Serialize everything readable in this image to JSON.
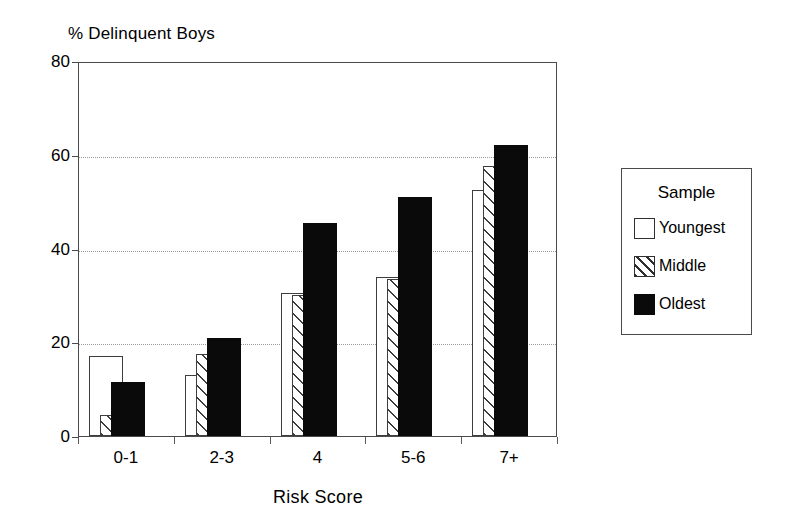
{
  "chart_data": {
    "type": "bar",
    "title": "",
    "xlabel": "Risk Score",
    "ylabel": "% Delinquent Boys",
    "categories": [
      "0-1",
      "2-3",
      "4",
      "5-6",
      "7+"
    ],
    "series": [
      {
        "name": "Youngest",
        "style": "open-white",
        "values": [
          17,
          13,
          30.5,
          34,
          52.5
        ]
      },
      {
        "name": "Middle",
        "style": "diagonal-hatch",
        "values": [
          4.5,
          17.5,
          30,
          33.5,
          57.5
        ]
      },
      {
        "name": "Oldest",
        "style": "solid-black",
        "values": [
          11.5,
          21,
          45.5,
          51,
          62
        ]
      }
    ],
    "ylim": [
      0,
      80
    ],
    "yticks": [
      0,
      20,
      40,
      60,
      80
    ],
    "ytick_labels": [
      "0",
      "20",
      "40",
      "60",
      "80"
    ],
    "grid": "horizontal-dotted",
    "gridlines_at": [
      20,
      40,
      60
    ],
    "legend_position": "right-outside",
    "bar_arrangement": "overlapping-offset"
  },
  "axes": {
    "y_title": "% Delinquent Boys",
    "x_title": "Risk Score",
    "y_ticks": [
      {
        "label": "80",
        "value": 80
      },
      {
        "label": "60",
        "value": 60
      },
      {
        "label": "40",
        "value": 40
      },
      {
        "label": "20",
        "value": 20
      },
      {
        "label": "0",
        "value": 0
      }
    ],
    "x_ticks": [
      {
        "label": "0-1"
      },
      {
        "label": "2-3"
      },
      {
        "label": "4"
      },
      {
        "label": "5-6"
      },
      {
        "label": "7+"
      }
    ]
  },
  "legend": {
    "title": "Sample",
    "items": [
      {
        "label": "Youngest",
        "swatch": "open-white-square",
        "color": "#ffffff"
      },
      {
        "label": "Middle",
        "swatch": "diagonal-hatch-square",
        "color": "#ffffff"
      },
      {
        "label": "Oldest",
        "swatch": "solid-black-square",
        "color": "#0a0a0a"
      }
    ]
  },
  "colors": {
    "axis": "#4a4a4a",
    "grid": "#9a9a9a",
    "ink": "#000000",
    "bar_outline": "#3d3d3d",
    "bar_solid": "#0a0a0a",
    "background": "#ffffff"
  }
}
